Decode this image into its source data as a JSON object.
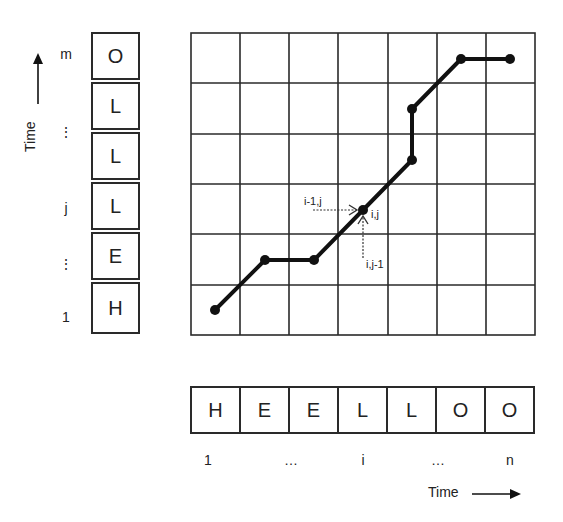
{
  "diagram": {
    "vertical_sequence": {
      "axis_label": "Time",
      "cells_top_to_bottom": [
        "O",
        "L",
        "L",
        "L",
        "E",
        "H"
      ],
      "tick_labels": [
        {
          "row_from_top": 0,
          "label": "m"
        },
        {
          "row_from_top": 1,
          "label": "⋮"
        },
        {
          "row_from_top": 3,
          "label": "j"
        },
        {
          "row_from_top": 4,
          "label": "⋮"
        },
        {
          "row_from_top": 5,
          "label": "1"
        }
      ]
    },
    "horizontal_sequence": {
      "axis_label": "Time",
      "cells": [
        "H",
        "E",
        "E",
        "L",
        "L",
        "O",
        "O"
      ],
      "tick_labels": [
        {
          "col": 0,
          "label": "1"
        },
        {
          "col": 2,
          "label": "…"
        },
        {
          "col": 3,
          "label": "i"
        },
        {
          "col": 4,
          "label": "…"
        },
        {
          "col": 6,
          "label": "n"
        }
      ]
    },
    "grid": {
      "columns": 7,
      "rows": 6,
      "line_color": "#2a2a2a"
    },
    "warping_path": {
      "color": "#111111",
      "points_col_row_from_bottom": [
        [
          0,
          0
        ],
        [
          1,
          1
        ],
        [
          2,
          1
        ],
        [
          3,
          2
        ],
        [
          4,
          3
        ],
        [
          4,
          4
        ],
        [
          5,
          5
        ],
        [
          6,
          5
        ]
      ]
    },
    "annotations": {
      "current_cell": "i,j",
      "left_predecessor": "i-1,j",
      "lower_predecessor": "i,j-1"
    }
  }
}
